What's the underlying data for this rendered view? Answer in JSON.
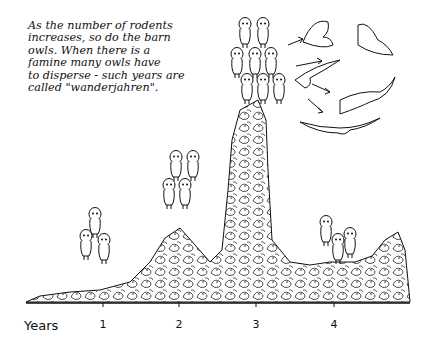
{
  "caption": "As the number of rodents\nincreases, so do the barn\nowls.  When there is a\nfamine many owls have\nto disperse - such years are\ncalled \"wanderjahren\".",
  "axis": {
    "label": "Years",
    "ticks": [
      {
        "label": "1",
        "x": 103
      },
      {
        "label": "2",
        "x": 179
      },
      {
        "label": "3",
        "x": 256
      },
      {
        "label": "4",
        "x": 334
      }
    ]
  },
  "colors": {
    "ink": "#111111",
    "background": "#ffffff"
  },
  "owl_groups": [
    {
      "name": "year-1-owls",
      "count": 3
    },
    {
      "name": "year-2-owls",
      "count": 4
    },
    {
      "name": "year-3-owls",
      "count": 10
    },
    {
      "name": "year-4-owls",
      "count": 3
    }
  ],
  "flying_owls": 5
}
